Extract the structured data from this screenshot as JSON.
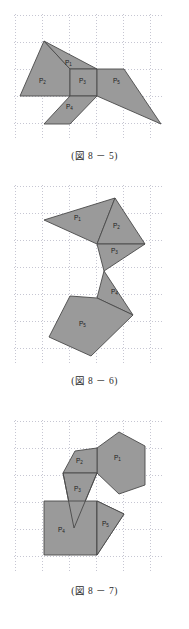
{
  "page": {
    "background_color": "#ffffff",
    "shape_fill_color": "#9a9a9a",
    "shape_stroke_color": "#4a4a4a",
    "grid_color": "#c6c6d2"
  },
  "figures": [
    {
      "id": "figure-8-5",
      "caption": "(図 8 － 5)",
      "labels": [
        {
          "name": "P",
          "sub": "1"
        },
        {
          "name": "P",
          "sub": "2"
        },
        {
          "name": "P",
          "sub": "3"
        },
        {
          "name": "P",
          "sub": "4"
        },
        {
          "name": "P",
          "sub": "5"
        }
      ]
    },
    {
      "id": "figure-8-6",
      "caption": "(図 8 － 6)",
      "labels": [
        {
          "name": "P",
          "sub": "1"
        },
        {
          "name": "P",
          "sub": "2"
        },
        {
          "name": "P",
          "sub": "3"
        },
        {
          "name": "P",
          "sub": "4"
        },
        {
          "name": "P",
          "sub": "5"
        }
      ]
    },
    {
      "id": "figure-8-7",
      "caption": "(図 8 － 7)",
      "labels": [
        {
          "name": "P",
          "sub": "1"
        },
        {
          "name": "P",
          "sub": "2"
        },
        {
          "name": "P",
          "sub": "3"
        },
        {
          "name": "P",
          "sub": "4"
        },
        {
          "name": "P",
          "sub": "5"
        }
      ]
    }
  ],
  "fig1": {
    "label1": "P",
    "label1sub": "1",
    "label2": "P",
    "label2sub": "2",
    "label3": "P",
    "label3sub": "3",
    "label4": "P",
    "label4sub": "4",
    "label5": "P",
    "label5sub": "5",
    "caption": "(図 8 － 5)"
  },
  "fig2": {
    "label1": "P",
    "label1sub": "1",
    "label2": "P",
    "label2sub": "2",
    "label3": "P",
    "label3sub": "3",
    "label4": "P",
    "label4sub": "4",
    "label5": "P",
    "label5sub": "5",
    "caption": "(図 8 － 6)"
  },
  "fig3": {
    "label1": "P",
    "label1sub": "1",
    "label2": "P",
    "label2sub": "2",
    "label3": "P",
    "label3sub": "3",
    "label4": "P",
    "label4sub": "4",
    "label5": "P",
    "label5sub": "5",
    "caption": "(図 8 － 7)"
  }
}
